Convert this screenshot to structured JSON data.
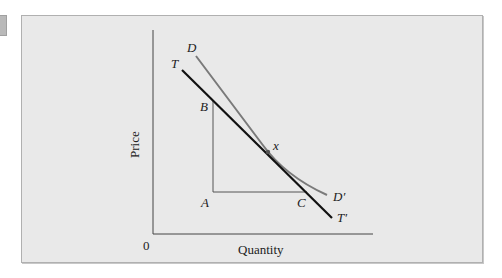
{
  "figure": {
    "axes": {
      "origin_label": "0",
      "x_label": "Quantity",
      "y_label": "Price"
    },
    "curves": {
      "demand": {
        "start_label": "D",
        "end_label": "D′",
        "color": "#7a7a7a"
      },
      "tangent": {
        "start_label": "T",
        "end_label": "T′",
        "color": "#111111"
      }
    },
    "points": {
      "A": "A",
      "B": "B",
      "C": "C",
      "x": "x"
    },
    "colors": {
      "panel_bg": "#e9e9e9",
      "panel_border": "#b0b0b0",
      "axis": "#444444"
    }
  }
}
